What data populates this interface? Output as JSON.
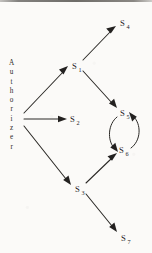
{
  "figure": {
    "type": "directed-graph-diagram",
    "background_color": "#fbfaf8",
    "ink_color": "#2b2926",
    "width": 152,
    "height": 253
  },
  "actor": {
    "name": "Authorizer",
    "orientation": "vertical",
    "letters": [
      "A",
      "u",
      "t",
      "h",
      "o",
      "r",
      "i",
      "z",
      "e",
      "r"
    ]
  },
  "nodes": [
    {
      "id": "S1",
      "base": "S",
      "sub": "1",
      "x": 76,
      "y": 66
    },
    {
      "id": "S2",
      "base": "S",
      "sub": "2",
      "x": 74,
      "y": 119
    },
    {
      "id": "S3",
      "base": "S",
      "sub": "3",
      "x": 79,
      "y": 189
    },
    {
      "id": "S4",
      "base": "S",
      "sub": "4",
      "x": 124,
      "y": 23
    },
    {
      "id": "S5",
      "base": "S",
      "sub": "5",
      "x": 125,
      "y": 113
    },
    {
      "id": "S6",
      "base": "S",
      "sub": "6",
      "x": 124,
      "y": 150
    },
    {
      "id": "S7",
      "base": "S",
      "sub": "7",
      "x": 126,
      "y": 238
    }
  ],
  "edges": [
    {
      "from": "Authorizer",
      "to": "S1",
      "style": "straight"
    },
    {
      "from": "Authorizer",
      "to": "S2",
      "style": "straight"
    },
    {
      "from": "Authorizer",
      "to": "S3",
      "style": "straight"
    },
    {
      "from": "S1",
      "to": "S4",
      "style": "straight"
    },
    {
      "from": "S1",
      "to": "S5",
      "style": "straight"
    },
    {
      "from": "S3",
      "to": "S6",
      "style": "straight"
    },
    {
      "from": "S3",
      "to": "S7",
      "style": "straight"
    },
    {
      "from": "S5",
      "to": "S6",
      "style": "curved-left"
    },
    {
      "from": "S6",
      "to": "S5",
      "style": "curved-right"
    }
  ]
}
